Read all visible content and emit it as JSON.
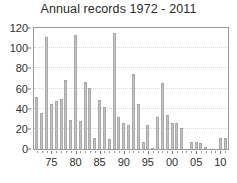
{
  "chart_data": {
    "type": "bar",
    "title": "Annual records 1972 - 2011",
    "xlabel": "",
    "ylabel": "",
    "ylim": [
      0,
      120
    ],
    "xlim": [
      1971.4,
      2011.6
    ],
    "grid": true,
    "legend": null,
    "y_ticks": [
      0,
      20,
      40,
      60,
      80,
      100,
      120
    ],
    "y_tick_labels": [
      "0",
      "20",
      "40",
      "60",
      "80",
      "100",
      "120"
    ],
    "x_ticks": [
      1975,
      1980,
      1985,
      1990,
      1995,
      2000,
      2005,
      2010
    ],
    "x_tick_labels": [
      "75",
      "80",
      "85",
      "90",
      "95",
      "00",
      "05",
      "10"
    ],
    "categories": [
      "1972",
      "1973",
      "1974",
      "1975",
      "1976",
      "1977",
      "1978",
      "1979",
      "1980",
      "1981",
      "1982",
      "1983",
      "1984",
      "1985",
      "1986",
      "1987",
      "1988",
      "1989",
      "1990",
      "1991",
      "1992",
      "1993",
      "1994",
      "1995",
      "1996",
      "1997",
      "1998",
      "1999",
      "2000",
      "2001",
      "2002",
      "2003",
      "2004",
      "2005",
      "2006",
      "2007",
      "2008",
      "2009",
      "2010",
      "2011"
    ],
    "values": [
      52,
      36,
      111,
      45,
      48,
      50,
      68,
      29,
      113,
      28,
      66,
      61,
      11,
      49,
      42,
      10,
      115,
      32,
      26,
      24,
      74,
      45,
      7,
      24,
      1,
      32,
      65,
      34,
      26,
      26,
      21,
      0,
      7,
      7,
      6,
      2,
      0,
      0,
      11,
      11
    ],
    "bar_color": "#c2c2c2",
    "bar_edge_color": "#a5a5a5",
    "axis_color": "#9a9a9a",
    "grid_color": "#d6d6d6",
    "text_color": "#2b2b2b",
    "background_color": "#ffffff"
  }
}
